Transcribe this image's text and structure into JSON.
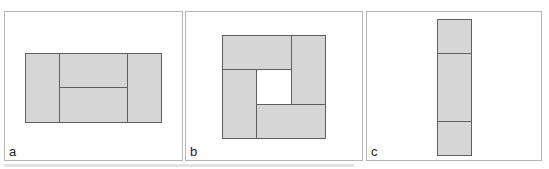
{
  "figure": {
    "panels": [
      {
        "label": "a",
        "description": "Rectangle divided into left column, right column, and two stacked middle tiles",
        "tiles": 4
      },
      {
        "label": "b",
        "description": "Square made of four rectangles arranged pinwheel-style around a central empty square",
        "tiles": 4
      },
      {
        "label": "c",
        "description": "Tall narrow column divided into three stacked tiles",
        "tiles": 3
      }
    ],
    "colors": {
      "tile_fill": "#d6d6d6",
      "tile_stroke": "#5f5f5f",
      "panel_border": "#b5b5b5",
      "background": "#ffffff"
    }
  }
}
